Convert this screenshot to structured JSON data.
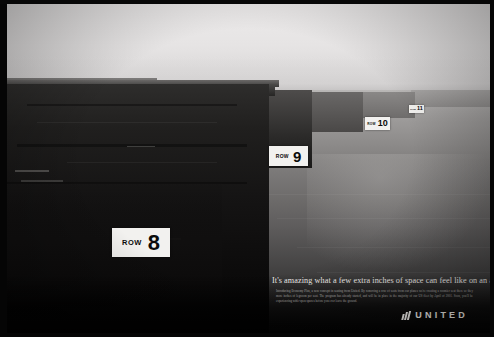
{
  "ad": {
    "brand": "UNITED",
    "logo_icon": "united-tulip-icon",
    "headline": "It's amazing what a few extra inches of space can feel like on an airplane.",
    "body_copy": "Introducing Economy Plus, a new concept in seating from United. By removing a row of seats from our planes we're creating a roomier seat there so they more inches of legroom per seat. The program has already started, and will be in place in the majority of our US fleet by April of 2001. Soon, you'll be experiencing wide-open spaces before you ever leave the ground.",
    "scene": {
      "subject": "sea cliffs",
      "treatment": "black-and-white photograph"
    }
  },
  "row_markers": [
    {
      "id": "row-8",
      "label": "ROW",
      "number": "8"
    },
    {
      "id": "row-9",
      "label": "ROW",
      "number": "9"
    },
    {
      "id": "row-10",
      "label": "ROW",
      "number": "10"
    },
    {
      "id": "row-11",
      "label": "ROW",
      "number": "11"
    }
  ],
  "colors": {
    "marker_background": "#f2f1ef",
    "marker_text": "#0b0b0b",
    "headline_text": "#ece9e6",
    "body_text": "#a9a6a3",
    "logo_text": "#e9e7e4",
    "frame": "#050505"
  }
}
